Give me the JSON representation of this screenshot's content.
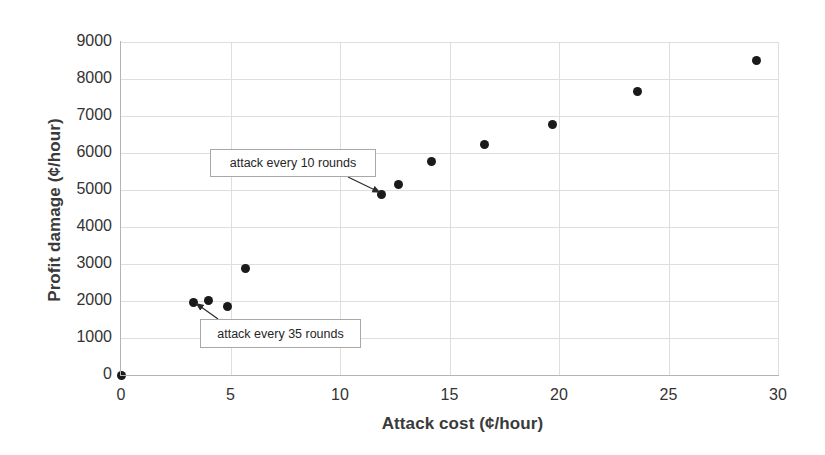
{
  "chart_data": {
    "type": "scatter",
    "title": "",
    "xlabel": "Attack cost (¢/hour)",
    "ylabel": "Profit damage (¢/hour)",
    "xlim": [
      0,
      30
    ],
    "ylim": [
      0,
      9000
    ],
    "xticks": [
      0,
      5,
      10,
      15,
      20,
      25,
      30
    ],
    "xtick_labels": [
      "0",
      "5",
      "10",
      "15",
      "20",
      "25",
      "30"
    ],
    "yticks": [
      0,
      1000,
      2000,
      3000,
      4000,
      5000,
      6000,
      7000,
      8000,
      9000
    ],
    "ytick_labels": [
      "0",
      "1000",
      "2000",
      "3000",
      "4000",
      "5000",
      "6000",
      "7000",
      "8000",
      "9000"
    ],
    "grid": true,
    "legend": false,
    "marker_color": "#1a1a1a",
    "grid_color": "#dedede",
    "series": [
      {
        "name": "attack frequency sweep",
        "points": [
          {
            "x": 0.0,
            "y": 0
          },
          {
            "x": 3.3,
            "y": 1960
          },
          {
            "x": 4.0,
            "y": 2010
          },
          {
            "x": 4.85,
            "y": 1850
          },
          {
            "x": 5.7,
            "y": 2890
          },
          {
            "x": 11.9,
            "y": 4870
          },
          {
            "x": 12.65,
            "y": 5150
          },
          {
            "x": 14.2,
            "y": 5780
          },
          {
            "x": 16.6,
            "y": 6240
          },
          {
            "x": 19.7,
            "y": 6770
          },
          {
            "x": 23.6,
            "y": 7660
          },
          {
            "x": 29.0,
            "y": 8510
          }
        ]
      }
    ],
    "annotations": [
      {
        "id": "attack-10-rounds",
        "text": "attack every 10 rounds",
        "points_to": {
          "x": 11.9,
          "y": 4870
        }
      },
      {
        "id": "attack-35-rounds",
        "text": "attack every 35 rounds",
        "points_to": {
          "x": 3.3,
          "y": 1960
        }
      }
    ]
  }
}
